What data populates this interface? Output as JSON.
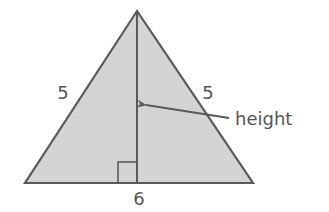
{
  "diagram": {
    "type": "isosceles-triangle",
    "colors": {
      "fill": "#d4d4d4",
      "stroke": "#5a5a5a",
      "text": "#555555",
      "background": "#ffffff"
    },
    "vertices": {
      "apex": [
        137,
        11
      ],
      "base_left": [
        25,
        183
      ],
      "base_right": [
        253,
        183
      ]
    },
    "labels": {
      "left_side": "5",
      "right_side": "5",
      "base": "6",
      "height": "height"
    },
    "height_line": {
      "x": 137,
      "y1": 11,
      "y2": 183
    },
    "right_angle_marker": {
      "x": 118,
      "y": 162,
      "size": 20
    },
    "arrow": {
      "from": [
        228,
        118
      ],
      "to": [
        144,
        105
      ]
    }
  }
}
